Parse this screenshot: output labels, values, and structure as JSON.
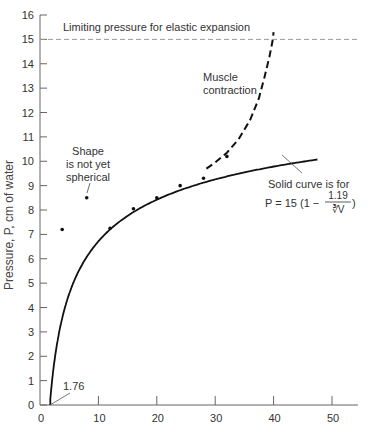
{
  "chart_data": {
    "type": "line",
    "title": "",
    "xlabel": "",
    "ylabel": "Pressure, P, cm of water",
    "xlim": [
      0,
      55
    ],
    "ylim": [
      0,
      16
    ],
    "x_ticks": [
      0,
      10,
      20,
      30,
      40,
      50
    ],
    "y_ticks": [
      0,
      1,
      2,
      3,
      4,
      5,
      6,
      7,
      8,
      9,
      10,
      11,
      12,
      13,
      14,
      15,
      16
    ],
    "grid": false,
    "legend": null,
    "series": [
      {
        "name": "Solid curve: P = 15 (1 - 1.19 / cube-root V)",
        "style": "solid",
        "formula": {
          "a": 15,
          "b": 1.19
        },
        "x_range": [
          1.76,
          47.5
        ]
      },
      {
        "name": "Muscle contraction",
        "style": "dashed",
        "x": [
          28.5,
          30,
          32,
          34,
          36,
          37.5,
          38.5,
          39.3,
          39.8,
          40
        ],
        "y": [
          9.7,
          9.95,
          10.35,
          10.9,
          11.7,
          12.6,
          13.5,
          14.3,
          14.9,
          15.3
        ]
      },
      {
        "name": "Measured points",
        "style": "points",
        "x": [
          3.8,
          8,
          12,
          16,
          20,
          24,
          28,
          32
        ],
        "y": [
          7.2,
          8.5,
          7.25,
          8.05,
          8.5,
          9.0,
          9.3,
          10.2
        ]
      },
      {
        "name": "Limiting pressure for elastic expansion",
        "style": "reference-dashed",
        "y": 15
      }
    ],
    "annotations": [
      {
        "text": "Limiting pressure for elastic expansion",
        "x": 3,
        "y": 15.5
      },
      {
        "text": "Muscle contraction",
        "lines": [
          "Muscle",
          "contraction"
        ],
        "x": 33,
        "y": 13.2
      },
      {
        "text": "Shape is not yet spherical",
        "lines": [
          "Shape",
          "is not yet",
          "spherical"
        ],
        "x": 9,
        "y": 10.3
      },
      {
        "text": "Solid curve is for",
        "x": 41,
        "y": 9.1
      },
      {
        "text": "P = 15 (1 − 1.19/∛V)",
        "x": 41,
        "y": 8.1
      },
      {
        "text": "1.76",
        "x": 4,
        "y": 0.8
      }
    ]
  },
  "labels": {
    "limit": "Limiting pressure for elastic expansion",
    "muscle_1": "Muscle",
    "muscle_2": "contraction",
    "shape_1": "Shape",
    "shape_2": "is not yet",
    "shape_3": "spherical",
    "solid_1": "Solid curve is for",
    "formula_left": "P = 15 (1 −",
    "formula_num": "1.19",
    "formula_den": "∛V",
    "formula_right": ")",
    "start_value": "1.76",
    "ylabel": "Pressure, P, cm of water"
  },
  "colors": {
    "axis": "#666666",
    "curve": "#111111",
    "text": "#333333",
    "limit_line": "#999999"
  }
}
